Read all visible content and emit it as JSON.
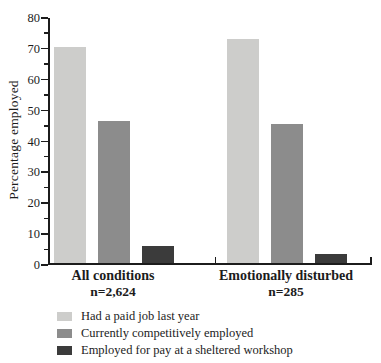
{
  "chart_data": {
    "type": "bar",
    "title": "",
    "ylabel": "Percentage employed",
    "ylim": [
      0,
      80
    ],
    "ytick_major_step": 10,
    "ytick_minor_step": 5,
    "grid": false,
    "legend_position": "bottom-left",
    "axis_color": "#1c1c1c",
    "groups": [
      {
        "label": "All conditions",
        "n_label": "n=2,624",
        "values": [
          70,
          46,
          5.5
        ]
      },
      {
        "label": "Emotionally disturbed",
        "n_label": "n=285",
        "values": [
          72.5,
          45,
          3
        ]
      }
    ],
    "series": [
      {
        "name": "Had a paid job last year",
        "color": "#cdcdcb",
        "values": [
          70,
          72.5
        ]
      },
      {
        "name": "Currently competitively employed",
        "color": "#8c8c8c",
        "values": [
          46,
          45
        ]
      },
      {
        "name": "Employed for pay at a sheltered workshop",
        "color": "#3b3b3b",
        "values": [
          5.5,
          3
        ]
      }
    ]
  }
}
